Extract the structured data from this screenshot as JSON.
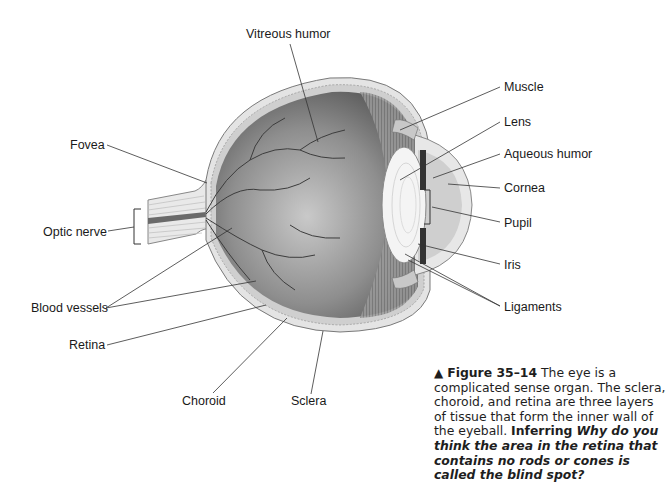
{
  "figure": {
    "type": "anatomical-diagram"
  },
  "labels": {
    "vitreous_humor": "Vitreous humor",
    "muscle": "Muscle",
    "lens": "Lens",
    "aqueous_humor": "Aqueous humor",
    "cornea": "Cornea",
    "pupil": "Pupil",
    "iris": "Iris",
    "ligaments": "Ligaments",
    "fovea": "Fovea",
    "optic_nerve": "Optic nerve",
    "blood_vessels": "Blood vessels",
    "retina": "Retina",
    "choroid": "Choroid",
    "sclera": "Sclera"
  },
  "caption": {
    "marker": "▲",
    "figure_number": "Figure 35–14",
    "text": " The eye is a complicated sense organ. The sclera, choroid, and retina are three layers of tissue that form the inner wall of the eyeball. ",
    "skill": "Inferring",
    "question": "Why do you think the area in the retina that contains no rods or cones is called the blind spot?"
  }
}
